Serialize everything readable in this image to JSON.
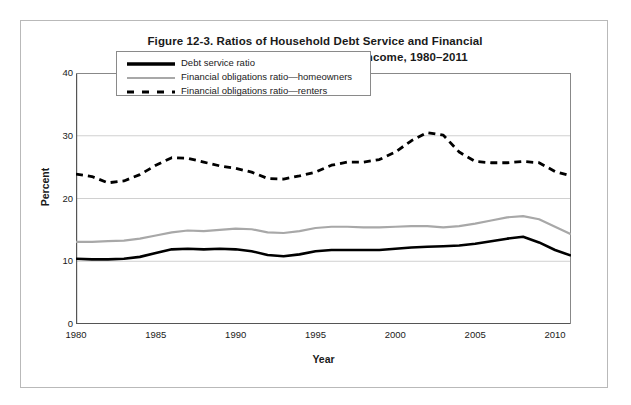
{
  "figure": {
    "title_lines": [
      "Figure 12-3. Ratios of Household Debt Service and Financial",
      "Obligations  to Disposable Personal Income, 1980–2011"
    ]
  },
  "axes": {
    "y_title": "Percent",
    "x_title": "Year",
    "y_ticks": [
      "0",
      "10",
      "20",
      "30",
      "40"
    ],
    "x_ticks": [
      "1980",
      "1985",
      "1990",
      "1995",
      "2000",
      "2005",
      "2010"
    ]
  },
  "legend": {
    "items": [
      {
        "label": "Debt service ratio",
        "style": "solid-black",
        "color": "#000000"
      },
      {
        "label": "Financial obligations ratio—homeowners",
        "style": "solid-gray",
        "color": "#a8a8a8"
      },
      {
        "label": "Financial obligations ratio—renters",
        "style": "dashed-black",
        "color": "#000000"
      }
    ]
  },
  "chart_data": {
    "type": "line",
    "title": "Figure 12-3. Ratios of Household Debt Service and Financial Obligations  to Disposable Personal Income, 1980–2011",
    "xlabel": "Year",
    "ylabel": "Percent",
    "xlim": [
      1980,
      2011
    ],
    "ylim": [
      0,
      40
    ],
    "ytick_step": 10,
    "xtick_step": 5,
    "grid": "horizontal",
    "legend_position": "upper-left-inside",
    "x": [
      1980,
      1981,
      1982,
      1983,
      1984,
      1985,
      1986,
      1987,
      1988,
      1989,
      1990,
      1991,
      1992,
      1993,
      1994,
      1995,
      1996,
      1997,
      1998,
      1999,
      2000,
      2001,
      2002,
      2003,
      2004,
      2005,
      2006,
      2007,
      2008,
      2009,
      2010,
      2011
    ],
    "series": [
      {
        "name": "Debt service ratio",
        "color": "#000000",
        "style": "solid",
        "width": 2.6,
        "values": [
          10.4,
          10.3,
          10.3,
          10.4,
          10.7,
          11.3,
          11.9,
          12.0,
          11.9,
          12.0,
          11.9,
          11.6,
          11.0,
          10.8,
          11.1,
          11.6,
          11.8,
          11.8,
          11.8,
          11.8,
          12.0,
          12.2,
          12.3,
          12.4,
          12.5,
          12.8,
          13.2,
          13.6,
          13.9,
          13.0,
          11.8,
          10.9
        ]
      },
      {
        "name": "Financial obligations ratio—homeowners",
        "color": "#a8a8a8",
        "style": "solid",
        "width": 2.2,
        "values": [
          13.1,
          13.1,
          13.2,
          13.3,
          13.6,
          14.1,
          14.6,
          14.9,
          14.8,
          15.0,
          15.2,
          15.1,
          14.6,
          14.5,
          14.8,
          15.3,
          15.5,
          15.5,
          15.4,
          15.4,
          15.5,
          15.6,
          15.6,
          15.4,
          15.6,
          16.0,
          16.5,
          17.0,
          17.2,
          16.7,
          15.5,
          14.3
        ]
      },
      {
        "name": "Financial obligations ratio—renters",
        "color": "#000000",
        "style": "dashed",
        "width": 2.8,
        "values": [
          23.9,
          23.5,
          22.5,
          22.8,
          23.8,
          25.3,
          26.5,
          26.4,
          25.8,
          25.2,
          24.8,
          24.2,
          23.2,
          23.1,
          23.6,
          24.2,
          25.3,
          25.8,
          25.8,
          26.2,
          27.4,
          29.2,
          30.5,
          30.1,
          27.4,
          25.9,
          25.7,
          25.7,
          25.9,
          25.7,
          24.3,
          23.6
        ]
      }
    ]
  }
}
